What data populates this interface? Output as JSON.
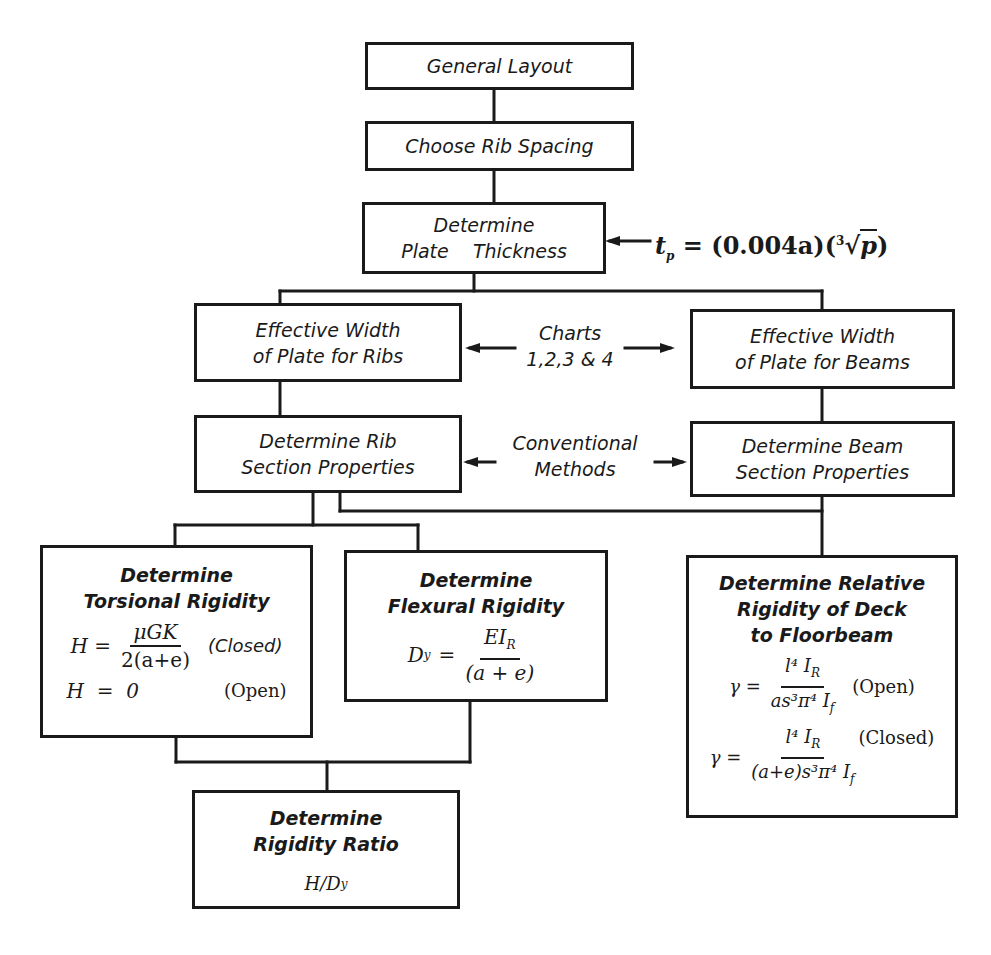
{
  "diagram": {
    "type": "flowchart",
    "nodes": {
      "general_layout": {
        "label": "General Layout"
      },
      "rib_spacing": {
        "label": "Choose Rib Spacing"
      },
      "plate_thickness": {
        "line1": "Determine",
        "line2": "Plate    Thickness"
      },
      "eff_width_ribs": {
        "line1": "Effective Width",
        "line2": "of Plate for Ribs"
      },
      "eff_width_beams": {
        "line1": "Effective Width",
        "line2": "of Plate for Beams"
      },
      "rib_section": {
        "line1": "Determine Rib",
        "line2": "Section Properties"
      },
      "beam_section": {
        "line1": "Determine Beam",
        "line2": "Section Properties"
      },
      "torsional": {
        "line1": "Determine",
        "line2": "Torsional Rigidity",
        "formula_lhs": "H =",
        "formula_num": "μGK",
        "formula_den": "2(a+e)",
        "formula_tag": "(Closed)",
        "formula2": "H  =  0",
        "formula2_tag": "(Open)"
      },
      "flexural": {
        "line1": "Determine",
        "line2": "Flexural Rigidity",
        "formula_lhs": "D",
        "formula_lhs_sub": "y",
        "formula_eq": "=",
        "formula_num": "EI",
        "formula_num_sub": "R",
        "formula_den": "(a + e)"
      },
      "relative": {
        "line1": "Determine Relative",
        "line2": "Rigidity of Deck",
        "line3": "to Floorbeam",
        "f1_lhs": "γ =",
        "f1_num": "l⁴ I",
        "f1_num_sub": "R",
        "f1_den": "as³π⁴ I",
        "f1_den_sub": "f",
        "f1_tag": "(Open)",
        "f2_lhs": "γ =",
        "f2_num": "l⁴ I",
        "f2_num_sub": "R",
        "f2_den": "(a+e)s³π⁴ I",
        "f2_den_sub": "f",
        "f2_tag": "(Closed)"
      },
      "rigidity_ratio": {
        "line1": "Determine",
        "line2": "Rigidity Ratio",
        "formula": "H/D",
        "formula_sub": "y"
      }
    },
    "annotations": {
      "plate_formula": {
        "lhs": "t",
        "lhs_sub": "p",
        "rhs": "= (0.004a)(",
        "root_index": "3",
        "radicand": "p",
        "close": ")"
      },
      "charts": {
        "line1": "Charts",
        "line2": "1,2,3 & 4"
      },
      "conventional": {
        "line1": "Conventional",
        "line2": "Methods"
      }
    },
    "colors": {
      "ink": "#1a1a1a",
      "paper": "#ffffff"
    }
  }
}
